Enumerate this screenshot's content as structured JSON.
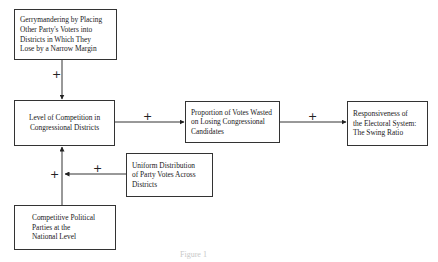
{
  "diagram": {
    "nodes": [
      {
        "id": "gerrymandering",
        "label": "Gerrymandering by Placing\nOther Party's Voters into\nDistricts in Which  They\nLose  by a Narrow Margin"
      },
      {
        "id": "competition",
        "label": "Level of Competition in\nCongressional Districts"
      },
      {
        "id": "wasted_votes",
        "label": "Proportion of Votes Wasted\non Losing Congressional\nCandidates"
      },
      {
        "id": "responsiveness",
        "label": "Responsiveness  of\nthe Electoral System:\nThe Swing Ratio"
      },
      {
        "id": "uniform_distribution",
        "label": "Uniform Distribution\nof Party Votes Across\nDistricts"
      },
      {
        "id": "competitive_parties",
        "label": "Competitive Political\nParties at the\nNational Level"
      }
    ],
    "edges": [
      {
        "from": "gerrymandering",
        "to": "competition",
        "sign": "+"
      },
      {
        "from": "competition",
        "to": "wasted_votes",
        "sign": "+"
      },
      {
        "from": "wasted_votes",
        "to": "responsiveness",
        "sign": "+"
      },
      {
        "from": "uniform_distribution",
        "to": "competition",
        "sign": "+"
      },
      {
        "from": "competitive_parties",
        "to": "competition",
        "sign": "+"
      }
    ],
    "caption": "Figure 1"
  }
}
